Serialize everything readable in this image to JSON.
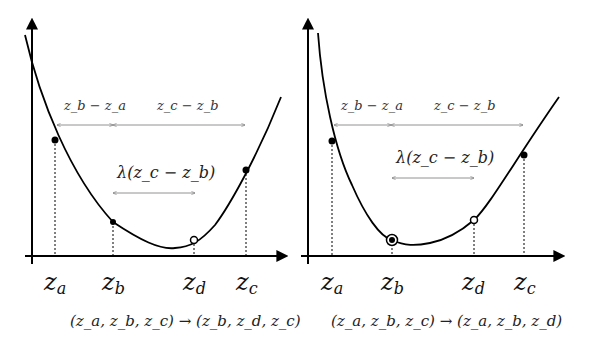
{
  "panels": [
    {
      "id": "left",
      "interval_labels": {
        "first": "z_b − z_a",
        "second": "z_c − z_b",
        "lambda": "λ(z_c − z_b)"
      },
      "ticks": [
        {
          "base": "z",
          "sub": "a"
        },
        {
          "base": "z",
          "sub": "b"
        },
        {
          "base": "z",
          "sub": "d"
        },
        {
          "base": "z",
          "sub": "c"
        }
      ],
      "formula": "(z_a, z_b, z_c) → (z_b, z_d, z_c)",
      "markers": {
        "a": "filled",
        "b": "filled",
        "d": "hollow",
        "c": "filled"
      }
    },
    {
      "id": "right",
      "interval_labels": {
        "first": "z_b − z_a",
        "second": "z_c − z_b",
        "lambda": "λ(z_c − z_b)"
      },
      "ticks": [
        {
          "base": "z",
          "sub": "a"
        },
        {
          "base": "z",
          "sub": "b"
        },
        {
          "base": "z",
          "sub": "d"
        },
        {
          "base": "z",
          "sub": "c"
        }
      ],
      "formula": "(z_a, z_b, z_c) → (z_a, z_b, z_d)",
      "markers": {
        "a": "filled",
        "b": "ringed",
        "d": "hollow",
        "c": "filled"
      }
    }
  ],
  "text": {
    "left_interval_first": "z_b − z_a",
    "left_interval_second": "z_c − z_b",
    "left_lambda": "λ(z_c − z_b)",
    "right_interval_first": "z_b − z_a",
    "right_interval_second": "z_c − z_b",
    "right_lambda": "λ(z_c − z_b)",
    "tick_base": "z",
    "sub_a": "a",
    "sub_b": "b",
    "sub_c": "c",
    "sub_d": "d",
    "left_formula": "(z_a, z_b, z_c) → (z_b, z_d, z_c)",
    "right_formula": "(z_a, z_b, z_c) → (z_a, z_b, z_d)"
  }
}
